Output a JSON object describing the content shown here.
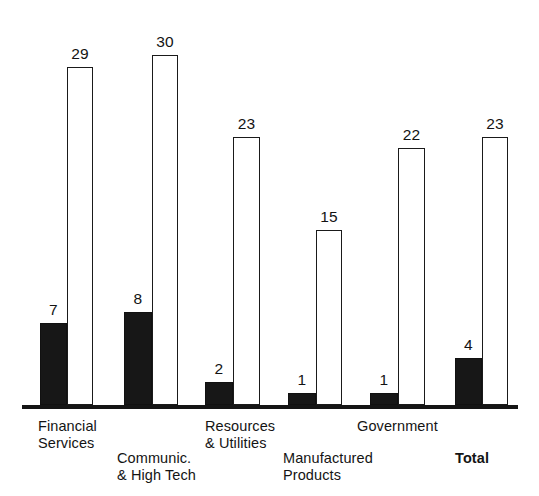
{
  "chart_data": {
    "type": "bar",
    "title": "",
    "subtitle": "",
    "xlabel": "",
    "ylabel": "",
    "ylim": [
      0,
      30
    ],
    "grid": false,
    "legend": "none",
    "axis": {
      "baseline_only": true,
      "ticks": [],
      "tick_labels": []
    },
    "categories": [
      "Financial\nServices",
      "Communic.\n& High Tech",
      "Resources\n& Utilities",
      "Manufactured\nProducts",
      "Government",
      "Total"
    ],
    "series": [
      {
        "name": "series-1",
        "style": "filled-black",
        "color": "#171717",
        "values": [
          7,
          8,
          2,
          1,
          1,
          4
        ]
      },
      {
        "name": "series-2",
        "style": "outlined-white",
        "color": "#ffffff",
        "values": [
          29,
          30,
          23,
          15,
          22,
          23
        ]
      }
    ],
    "data_labels": [
      "7",
      "29",
      "8",
      "30",
      "2",
      "23",
      "1",
      "15",
      "1",
      "22",
      "4",
      "23"
    ]
  },
  "groups": [
    {
      "id": "financial-services",
      "label_line1": "Financial",
      "label_line2": "Services",
      "label_bold": false,
      "label_x": 38,
      "label_y": 418,
      "dark": {
        "value": 7,
        "label": "7",
        "x": 40,
        "width": 27
      },
      "light": {
        "value": 29,
        "label": "29",
        "x": 67,
        "width": 26
      }
    },
    {
      "id": "communic-high-tech",
      "label_line1": "Communic.",
      "label_line2": "& High Tech",
      "label_bold": false,
      "label_x": 117,
      "label_y": 450,
      "dark": {
        "value": 8,
        "label": "8",
        "x": 124,
        "width": 28
      },
      "light": {
        "value": 30,
        "label": "30",
        "x": 152,
        "width": 26
      }
    },
    {
      "id": "resources-utilities",
      "label_line1": "Resources",
      "label_line2": "& Utilities",
      "label_bold": false,
      "label_x": 205,
      "label_y": 418,
      "dark": {
        "value": 2,
        "label": "2",
        "x": 205,
        "width": 28
      },
      "light": {
        "value": 23,
        "label": "23",
        "x": 233,
        "width": 27
      }
    },
    {
      "id": "manufactured-products",
      "label_line1": "Manufactured",
      "label_line2": "Products",
      "label_bold": false,
      "label_x": 283,
      "label_y": 450,
      "dark": {
        "value": 1,
        "label": "1",
        "x": 288,
        "width": 28
      },
      "light": {
        "value": 15,
        "label": "15",
        "x": 316,
        "width": 26
      }
    },
    {
      "id": "government",
      "label_line1": "Government",
      "label_line2": "",
      "label_bold": false,
      "label_x": 357,
      "label_y": 418,
      "dark": {
        "value": 1,
        "label": "1",
        "x": 370,
        "width": 28
      },
      "light": {
        "value": 22,
        "label": "22",
        "x": 398,
        "width": 27
      }
    },
    {
      "id": "total",
      "label_line1": "Total",
      "label_line2": "",
      "label_bold": true,
      "label_x": 455,
      "label_y": 450,
      "dark": {
        "value": 4,
        "label": "4",
        "x": 455,
        "width": 27
      },
      "light": {
        "value": 23,
        "label": "23",
        "x": 482,
        "width": 26
      }
    }
  ],
  "geometry": {
    "baseline_y": 405,
    "axis_x": 22,
    "axis_width": 496,
    "axis_height": 4,
    "px_per_unit": 11.67
  }
}
